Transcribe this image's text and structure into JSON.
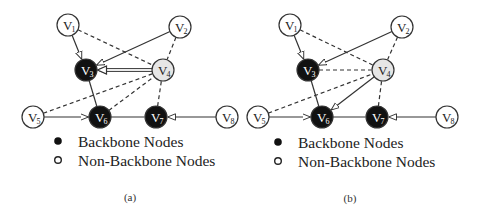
{
  "panels": [
    {
      "id": "a",
      "caption": "(a)",
      "nodes": [
        {
          "id": "V1",
          "letter": "V",
          "sub": "1",
          "x": 68,
          "y": 25,
          "type": "non-backbone"
        },
        {
          "id": "V2",
          "letter": "V",
          "sub": "2",
          "x": 180,
          "y": 27,
          "type": "non-backbone"
        },
        {
          "id": "V3",
          "letter": "V",
          "sub": "3",
          "x": 86,
          "y": 70,
          "type": "backbone"
        },
        {
          "id": "V4",
          "letter": "V",
          "sub": "4",
          "x": 163,
          "y": 70,
          "type": "highlight"
        },
        {
          "id": "V5",
          "letter": "V",
          "sub": "5",
          "x": 33,
          "y": 117,
          "type": "non-backbone"
        },
        {
          "id": "V6",
          "letter": "V",
          "sub": "6",
          "x": 100,
          "y": 117,
          "type": "backbone"
        },
        {
          "id": "V7",
          "letter": "V",
          "sub": "7",
          "x": 156,
          "y": 117,
          "type": "backbone"
        },
        {
          "id": "V8",
          "letter": "V",
          "sub": "8",
          "x": 227,
          "y": 117,
          "type": "non-backbone"
        }
      ],
      "edges": [
        {
          "from": "V1",
          "to": "V3",
          "style": "solid",
          "arrow": true
        },
        {
          "from": "V2",
          "to": "V3",
          "style": "solid",
          "arrow": true
        },
        {
          "from": "V4",
          "to": "V3",
          "style": "double",
          "arrow": true
        },
        {
          "from": "V1",
          "to": "V4",
          "style": "dashed",
          "arrow": false
        },
        {
          "from": "V2",
          "to": "V4",
          "style": "dashed",
          "arrow": false
        },
        {
          "from": "V3",
          "to": "V6",
          "style": "solid",
          "arrow": false
        },
        {
          "from": "V5",
          "to": "V4",
          "style": "dashed",
          "arrow": false
        },
        {
          "from": "V6",
          "to": "V4",
          "style": "dashed",
          "arrow": false
        },
        {
          "from": "V7",
          "to": "V4",
          "style": "dashed",
          "arrow": false
        },
        {
          "from": "V5",
          "to": "V6",
          "style": "solid",
          "arrow": true
        },
        {
          "from": "V6",
          "to": "V7",
          "style": "solid",
          "arrow": false
        },
        {
          "from": "V8",
          "to": "V7",
          "style": "solid",
          "arrow": true
        }
      ],
      "legend": {
        "x": 58,
        "y": 141
      },
      "caption_pos": {
        "x": 130,
        "y": 201
      }
    },
    {
      "id": "b",
      "caption": "(b)",
      "nodes": [
        {
          "id": "V1",
          "letter": "V",
          "sub": "1",
          "x": 290,
          "y": 25,
          "type": "non-backbone"
        },
        {
          "id": "V2",
          "letter": "V",
          "sub": "2",
          "x": 402,
          "y": 27,
          "type": "non-backbone"
        },
        {
          "id": "V3",
          "letter": "V",
          "sub": "3",
          "x": 308,
          "y": 70,
          "type": "backbone"
        },
        {
          "id": "V4",
          "letter": "V",
          "sub": "4",
          "x": 383,
          "y": 70,
          "type": "highlight"
        },
        {
          "id": "V5",
          "letter": "V",
          "sub": "5",
          "x": 258,
          "y": 117,
          "type": "non-backbone"
        },
        {
          "id": "V6",
          "letter": "V",
          "sub": "6",
          "x": 322,
          "y": 117,
          "type": "backbone"
        },
        {
          "id": "V7",
          "letter": "V",
          "sub": "7",
          "x": 377,
          "y": 117,
          "type": "backbone"
        },
        {
          "id": "V8",
          "letter": "V",
          "sub": "8",
          "x": 447,
          "y": 117,
          "type": "non-backbone"
        }
      ],
      "edges": [
        {
          "from": "V1",
          "to": "V3",
          "style": "solid",
          "arrow": true
        },
        {
          "from": "V2",
          "to": "V3",
          "style": "solid",
          "arrow": true
        },
        {
          "from": "V3",
          "to": "V4",
          "style": "dashed",
          "arrow": false
        },
        {
          "from": "V1",
          "to": "V4",
          "style": "dashed",
          "arrow": false
        },
        {
          "from": "V2",
          "to": "V4",
          "style": "dashed",
          "arrow": false
        },
        {
          "from": "V3",
          "to": "V6",
          "style": "solid",
          "arrow": false
        },
        {
          "from": "V5",
          "to": "V4",
          "style": "dashed",
          "arrow": false
        },
        {
          "from": "V4",
          "to": "V6",
          "style": "solid",
          "arrow": true
        },
        {
          "from": "V7",
          "to": "V4",
          "style": "dashed",
          "arrow": false
        },
        {
          "from": "V5",
          "to": "V6",
          "style": "solid",
          "arrow": true
        },
        {
          "from": "V6",
          "to": "V7",
          "style": "solid",
          "arrow": false
        },
        {
          "from": "V8",
          "to": "V7",
          "style": "solid",
          "arrow": true
        }
      ],
      "legend": {
        "x": 278,
        "y": 142
      },
      "caption_pos": {
        "x": 350,
        "y": 202
      }
    }
  ],
  "legend": {
    "backbone_label": "Backbone Nodes",
    "non_backbone_label": "Non-Backbone Nodes"
  },
  "colors": {
    "backbone_fill": "#111111",
    "non_backbone_fill": "#ffffff",
    "highlight_fill": "#e6e6e6",
    "stroke": "#333333"
  }
}
